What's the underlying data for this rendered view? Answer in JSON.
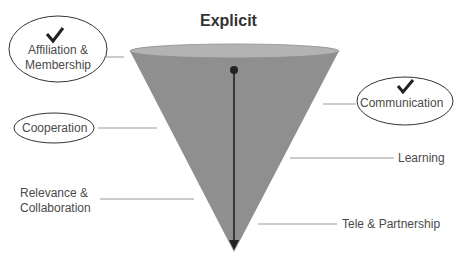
{
  "title": "Explicit",
  "labels": {
    "affiliation": "Affiliation &",
    "membership": "Membership",
    "cooperation": "Cooperation",
    "relevance": "Relevance &",
    "collaboration": "Collaboration",
    "communication": "Communication",
    "learning": "Learning",
    "tele": "Tele & Partnership"
  },
  "checked": [
    "Affiliation & Membership",
    "Communication"
  ],
  "colors": {
    "cone_fill": "#8f8f8f",
    "cone_top": "#b5b5b5",
    "arrow": "#222222",
    "leader": "#999999"
  }
}
